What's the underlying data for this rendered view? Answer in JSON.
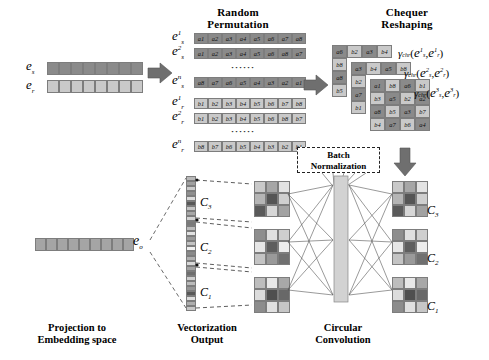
{
  "headings": {
    "random_permutation": [
      "Random",
      "Permutation"
    ],
    "chequer_reshaping": [
      "Chequer",
      "Reshaping"
    ],
    "batch_normalization": [
      "Batch",
      "Normalization"
    ]
  },
  "captions": {
    "projection": [
      "Projection to",
      "Embedding space"
    ],
    "vectorization": [
      "Vectorization",
      "Output"
    ],
    "circular_convolution": [
      "Circular",
      "Convolution"
    ]
  },
  "embeddings": {
    "es_label": "e",
    "es_sub": "s",
    "er_label": "e",
    "er_sub": "r",
    "eo_label": "e",
    "eo_sub": "o",
    "es_cells": 8,
    "er_cells": 8,
    "eo_cells": 9
  },
  "permutation": {
    "ellipsis": "······",
    "subject_rows": [
      {
        "sup": "1",
        "sub": "s",
        "values": [
          "a1",
          "a2",
          "a3",
          "a4",
          "a5",
          "a6",
          "a7",
          "a8"
        ]
      },
      {
        "sup": "2",
        "sub": "s",
        "values": [
          "a1",
          "a2",
          "a3",
          "a4",
          "a5",
          "a6",
          "a8",
          "a7"
        ]
      },
      {
        "sup": "n",
        "sub": "s",
        "values": [
          "a8",
          "a7",
          "a6",
          "a5",
          "a4",
          "a3",
          "a2",
          "a1"
        ]
      }
    ],
    "relation_rows": [
      {
        "sup": "1",
        "sub": "r",
        "values": [
          "b1",
          "b2",
          "b3",
          "b4",
          "b5",
          "b6",
          "b7",
          "b8"
        ]
      },
      {
        "sup": "2",
        "sub": "r",
        "values": [
          "b1",
          "b2",
          "b3",
          "b4",
          "b5",
          "b6",
          "b8",
          "b7"
        ]
      },
      {
        "sup": "n",
        "sub": "r",
        "values": [
          "b8",
          "b7",
          "b6",
          "b5",
          "b4",
          "b3",
          "b2",
          "b1"
        ]
      }
    ]
  },
  "chequer": {
    "grids": [
      {
        "name": "grid-back",
        "rows": [
          [
            "a6",
            "b2",
            "a3",
            "b4"
          ],
          [
            "b8",
            "",
            "",
            ""
          ],
          [
            "a8",
            "",
            "",
            ""
          ],
          [
            "b5",
            "",
            "",
            ""
          ]
        ]
      },
      {
        "name": "grid-mid",
        "rows": [
          [
            "a3",
            "b4",
            "a5",
            "b8"
          ],
          [
            "b2",
            "",
            "",
            ""
          ],
          [
            "a7",
            "",
            "",
            ""
          ],
          [
            "b1",
            "",
            "",
            ""
          ]
        ]
      },
      {
        "name": "grid-front",
        "rows": [
          [
            "a1",
            "b8",
            "a6",
            "b1"
          ],
          [
            "b3",
            "a5",
            "b2",
            "a2"
          ],
          [
            "a8",
            "b5",
            "a3",
            "b7"
          ],
          [
            "b4",
            "a7",
            "b6",
            "a4"
          ]
        ]
      }
    ],
    "gamma_labels": [
      {
        "fn": "γ",
        "sub": "chr",
        "sup": "1"
      },
      {
        "fn": "γ",
        "sub": "chr",
        "sup": "2"
      },
      {
        "fn": "γ",
        "sub": "chr",
        "sup": "3"
      }
    ],
    "gamma_arg_s": "e",
    "gamma_arg_s_sub": "s",
    "gamma_arg_r": "e",
    "gamma_arg_r_sub": "r"
  },
  "vectorization": {
    "labels": [
      "C",
      "C",
      "C"
    ],
    "label_subs": [
      "3",
      "2",
      "1"
    ],
    "column_shades": [
      "#b9b9b9",
      "#a0a0a0",
      "#cccccc",
      "#8f8f8f",
      "#dcdcdc",
      "#585858",
      "#c6c6c6",
      "#a8a8a8",
      "#d4d4d4",
      "#7a7a7a",
      "#bdbdbd",
      "#e2e2e2",
      "#9a9a9a",
      "#c2c2c2",
      "#efefef",
      "#8a8a8a",
      "#b2b2b2",
      "#d8d8d8",
      "#a4a4a4",
      "#6e6e6e",
      "#cfcfcf",
      "#bbbbbb",
      "#969696",
      "#585858",
      "#dedede",
      "#aeaeae",
      "#c8c8c8"
    ]
  },
  "conv_inputs": [
    {
      "name": "conv-input-3",
      "cells": [
        "#c9c9c9",
        "#a6a6a6",
        "#e3e3e3",
        "#b5b5b5",
        "#555555",
        "#cfcfcf",
        "#5a5a5a",
        "#d7d7d7",
        "#a2a2a2"
      ]
    },
    {
      "name": "conv-input-2",
      "cells": [
        "#8e8e8e",
        "#e0e0e0",
        "#cfcfcf",
        "#e6e6e6",
        "#5e5e5e",
        "#ededed",
        "#c4c4c4",
        "#9a9a9a",
        "#707070"
      ]
    },
    {
      "name": "conv-input-1",
      "cells": [
        "#bdbdbd",
        "#e8e8e8",
        "#a8a8a8",
        "#dcdcdc",
        "#4f4f4f",
        "#686868",
        "#8c8c8c",
        "#e0e0e0",
        "#c6c6c6"
      ]
    }
  ],
  "conv_outputs": [
    {
      "name": "conv-output-3",
      "label": "C",
      "sub": "3",
      "cells": [
        "#c9c9c9",
        "#a6a6a6",
        "#e3e3e3",
        "#b5b5b5",
        "#555555",
        "#cfcfcf",
        "#5a5a5a",
        "#d7d7d7",
        "#a2a2a2"
      ]
    },
    {
      "name": "conv-output-2",
      "label": "C",
      "sub": "2",
      "cells": [
        "#8e8e8e",
        "#e0e0e0",
        "#cfcfcf",
        "#e6e6e6",
        "#5e5e5e",
        "#ededed",
        "#c4c4c4",
        "#9a9a9a",
        "#707070"
      ]
    },
    {
      "name": "conv-output-1",
      "label": "C",
      "sub": "1",
      "cells": [
        "#bdbdbd",
        "#e8e8e8",
        "#a8a8a8",
        "#dcdcdc",
        "#4f4f4f",
        "#686868",
        "#8c8c8c",
        "#e0e0e0",
        "#c6c6c6"
      ]
    }
  ],
  "colors": {
    "dark_cell": "#8a8a8a",
    "light_cell": "#c9c9c9",
    "arrow": "#6f6f6f",
    "line": "#555555",
    "border": "#7d7d7d"
  }
}
